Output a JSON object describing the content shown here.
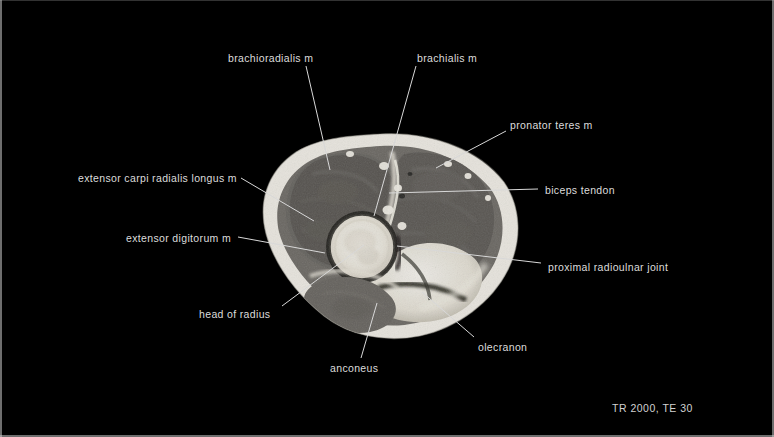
{
  "figure": {
    "modality": "MRI",
    "view": "axial cross-section of the elbow",
    "sequence_parameters": "TR 2000, TE 30"
  },
  "annotations": [
    {
      "id": "brachioradialis",
      "label": "brachioradialis m",
      "text_x": 228,
      "text_y": 53,
      "line": {
        "x1": 306,
        "y1": 66,
        "x2": 330,
        "y2": 170
      }
    },
    {
      "id": "brachialis",
      "label": "brachialis m",
      "text_x": 417,
      "text_y": 53,
      "line": {
        "x1": 416,
        "y1": 66,
        "x2": 374,
        "y2": 216
      }
    },
    {
      "id": "pronator-teres",
      "label": "pronator teres m",
      "text_x": 510,
      "text_y": 120,
      "line": {
        "x1": 506,
        "y1": 131,
        "x2": 436,
        "y2": 168
      }
    },
    {
      "id": "extensor-carpi-radialis-longus",
      "label": "extensor carpi radialis longus m",
      "text_x": 78,
      "text_y": 173,
      "line": {
        "x1": 241,
        "y1": 178,
        "x2": 314,
        "y2": 221
      }
    },
    {
      "id": "biceps-tendon",
      "label": "biceps tendon",
      "text_x": 545,
      "text_y": 185,
      "line": {
        "x1": 538,
        "y1": 189,
        "x2": 389,
        "y2": 193
      }
    },
    {
      "id": "extensor-digitorum",
      "label": "extensor digitorum m",
      "text_x": 126,
      "text_y": 233,
      "line": {
        "x1": 238,
        "y1": 237,
        "x2": 325,
        "y2": 253
      }
    },
    {
      "id": "proximal-radioulnar-joint",
      "label": "proximal radioulnar joint",
      "text_x": 548,
      "text_y": 262,
      "line": {
        "x1": 541,
        "y1": 263,
        "x2": 397,
        "y2": 246
      }
    },
    {
      "id": "head-of-radius",
      "label": "head of radius",
      "text_x": 199,
      "text_y": 309,
      "line": {
        "x1": 282,
        "y1": 306,
        "x2": 364,
        "y2": 245
      }
    },
    {
      "id": "olecranon",
      "label": "olecranon",
      "text_x": 478,
      "text_y": 342,
      "line": {
        "x1": 474,
        "y1": 337,
        "x2": 422,
        "y2": 292
      }
    },
    {
      "id": "anconeus",
      "label": "anconeus",
      "text_x": 330,
      "text_y": 363,
      "line": {
        "x1": 361,
        "y1": 358,
        "x2": 377,
        "y2": 303
      }
    }
  ],
  "colors": {
    "background": "#000000",
    "label_text": "#dcdcdc",
    "leader_line": "#d8d8d8",
    "fat_bright": "#f2f0ea",
    "muscle_mid": "#7d7a74",
    "muscle_dark": "#5d5a56",
    "bone_bright": "#efece4",
    "cortex_dark": "#2b2a28"
  }
}
